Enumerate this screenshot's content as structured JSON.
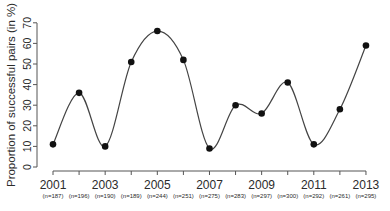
{
  "chart_data": {
    "type": "line",
    "title": "",
    "xlabel": "",
    "ylabel": "Proportion of successful pairs (in %)",
    "ylim": [
      0,
      70
    ],
    "yticks": [
      0,
      10,
      20,
      30,
      40,
      50,
      60,
      70
    ],
    "x": [
      2001,
      2002,
      2003,
      2004,
      2005,
      2006,
      2007,
      2008,
      2009,
      2010,
      2011,
      2012,
      2013
    ],
    "x_tick_labels": [
      "2001",
      "",
      "2003",
      "",
      "2005",
      "",
      "2007",
      "",
      "2009",
      "",
      "2011",
      "",
      "2013"
    ],
    "n_labels": [
      "(n=187)",
      "(n=196)",
      "(n=190)",
      "(n=189)",
      "(n=244)",
      "(n=251)",
      "(n=275)",
      "(n=283)",
      "(n=297)",
      "(n=300)",
      "(n=292)",
      "(n=261)",
      "(n=295)"
    ],
    "series": [
      {
        "name": "Proportion of successful pairs",
        "values": [
          11,
          36,
          10,
          51,
          66,
          52,
          9,
          30,
          26,
          41,
          11,
          28,
          59
        ]
      }
    ],
    "grid": false,
    "legend": null,
    "line_style": "smoothed spline with filled point markers"
  }
}
